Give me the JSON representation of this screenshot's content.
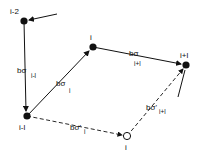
{
  "diagram": {
    "nodes": [
      {
        "id": "i-2",
        "label": "i-2",
        "x": 24,
        "y": 21,
        "filled": true
      },
      {
        "id": "i",
        "label": "i",
        "x": 93,
        "y": 47,
        "filled": true
      },
      {
        "id": "i+1",
        "label": "i+l",
        "x": 186,
        "y": 65,
        "filled": true
      },
      {
        "id": "i-1",
        "label": "i-l",
        "x": 27,
        "y": 116,
        "filled": true
      },
      {
        "id": "i-prime",
        "label": "i",
        "x": 127,
        "y": 136,
        "filled": false
      }
    ],
    "edges": [
      {
        "from": "i-2",
        "to": "i-1",
        "style": "solid",
        "label": "bσ",
        "sub": "i-l"
      },
      {
        "from": "i-1",
        "to": "i",
        "style": "solid",
        "label": "bσ",
        "sub": "i"
      },
      {
        "from": "i",
        "to": "i+1",
        "style": "solid",
        "label": "bσ",
        "sub": "i+l"
      },
      {
        "from": "i-1",
        "to": "i-prime",
        "style": "dashed",
        "label": "bσ'",
        "sub": "i"
      },
      {
        "from": "i-prime",
        "to": "i+1",
        "style": "dashed",
        "label": "bσ'",
        "sub": "i+l"
      }
    ],
    "labels": {
      "n_im2": "i-2",
      "n_i": "i",
      "n_ip1": "i+l",
      "n_im1": "i-l",
      "n_iprime": "i",
      "e1_main": "bσ",
      "e1_sub": "i-l",
      "e2_main": "bσ",
      "e2_sub": "i",
      "e3_main": "bσ",
      "e3_sub": "i+l",
      "e4_main": "bσ'",
      "e4_sub": "i",
      "e5_main": "bσ'",
      "e5_sub": "i+l"
    }
  }
}
